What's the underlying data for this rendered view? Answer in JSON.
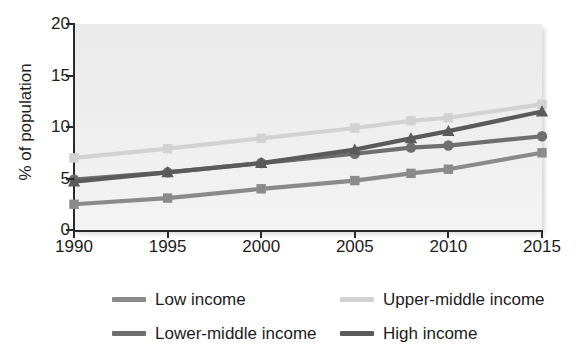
{
  "chart_data": {
    "type": "line",
    "title": "",
    "xlabel": "",
    "ylabel": "% of population",
    "xlim": [
      1990,
      2015
    ],
    "ylim": [
      0,
      20
    ],
    "grid": false,
    "legend_position": "bottom",
    "x_ticks": [
      "1990",
      "1995",
      "2000",
      "2005",
      "2010",
      "2015"
    ],
    "y_ticks": [
      "0",
      "5",
      "10",
      "15",
      "20"
    ],
    "x": [
      1990,
      1995,
      2000,
      2005,
      2008,
      2010,
      2015
    ],
    "series": [
      {
        "name": "Low income",
        "color": "#8a8a8a",
        "marker": "square",
        "values": [
          2.5,
          3.1,
          4.0,
          4.8,
          5.5,
          5.9,
          7.5
        ]
      },
      {
        "name": "Lower-middle income",
        "color": "#6e6e6e",
        "marker": "circle",
        "values": [
          4.9,
          5.6,
          6.5,
          7.4,
          8.0,
          8.2,
          9.1
        ]
      },
      {
        "name": "Upper-middle income",
        "color": "#d2d2d2",
        "marker": "square",
        "values": [
          7.0,
          7.9,
          8.9,
          9.9,
          10.6,
          10.9,
          12.2
        ]
      },
      {
        "name": "High income",
        "color": "#5a5a5a",
        "marker": "triangle",
        "values": [
          4.7,
          5.6,
          6.5,
          7.8,
          8.9,
          9.6,
          11.5
        ]
      }
    ]
  },
  "legend": {
    "items": [
      {
        "label": "Low income",
        "color": "#8a8a8a"
      },
      {
        "label": "Upper-middle income",
        "color": "#d2d2d2"
      },
      {
        "label": "Lower-middle income",
        "color": "#6e6e6e"
      },
      {
        "label": "High income",
        "color": "#5a5a5a"
      }
    ]
  },
  "axis": {
    "y_title": "% of population"
  }
}
